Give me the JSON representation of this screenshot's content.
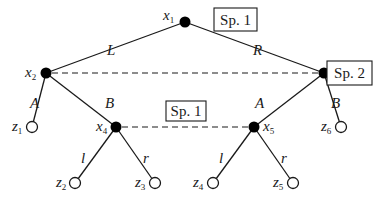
{
  "diagram": {
    "type": "extensive-form game tree",
    "nodes": [
      {
        "id": "x1",
        "name": "x",
        "sub": "1",
        "kind": "decision",
        "x": 185,
        "y": 22,
        "label_pos": "left"
      },
      {
        "id": "x2",
        "name": "x",
        "sub": "2",
        "kind": "decision",
        "x": 46,
        "y": 73,
        "label_pos": "left"
      },
      {
        "id": "x3",
        "name": "x",
        "sub": "3",
        "kind": "decision",
        "x": 324,
        "y": 73,
        "label_pos": "right"
      },
      {
        "id": "x4",
        "name": "x",
        "sub": "4",
        "kind": "decision",
        "x": 116,
        "y": 127,
        "label_pos": "left"
      },
      {
        "id": "x5",
        "name": "x",
        "sub": "5",
        "kind": "decision",
        "x": 254,
        "y": 127,
        "label_pos": "right"
      },
      {
        "id": "z1",
        "name": "z",
        "sub": "1",
        "kind": "terminal",
        "x": 32,
        "y": 127,
        "label_pos": "left"
      },
      {
        "id": "z2",
        "name": "z",
        "sub": "2",
        "kind": "terminal",
        "x": 75,
        "y": 183,
        "label_pos": "left"
      },
      {
        "id": "z3",
        "name": "z",
        "sub": "3",
        "kind": "terminal",
        "x": 155,
        "y": 183,
        "label_pos": "left"
      },
      {
        "id": "z4",
        "name": "z",
        "sub": "4",
        "kind": "terminal",
        "x": 213,
        "y": 183,
        "label_pos": "left"
      },
      {
        "id": "z5",
        "name": "z",
        "sub": "5",
        "kind": "terminal",
        "x": 293,
        "y": 183,
        "label_pos": "left"
      },
      {
        "id": "z6",
        "name": "z",
        "sub": "6",
        "kind": "terminal",
        "x": 341,
        "y": 127,
        "label_pos": "left"
      }
    ],
    "edges": [
      {
        "from": "x1",
        "to": "x2",
        "action": "L"
      },
      {
        "from": "x1",
        "to": "x3",
        "action": "R"
      },
      {
        "from": "x2",
        "to": "z1",
        "action": "A"
      },
      {
        "from": "x2",
        "to": "x4",
        "action": "B"
      },
      {
        "from": "x3",
        "to": "x5",
        "action": "A"
      },
      {
        "from": "x3",
        "to": "z6",
        "action": "B"
      },
      {
        "from": "x4",
        "to": "z2",
        "action": "l"
      },
      {
        "from": "x4",
        "to": "z3",
        "action": "r"
      },
      {
        "from": "x5",
        "to": "z4",
        "action": "l"
      },
      {
        "from": "x5",
        "to": "z5",
        "action": "r"
      }
    ],
    "information_sets": [
      {
        "nodes": [
          "x2",
          "x3"
        ],
        "style": "dashed"
      },
      {
        "nodes": [
          "x4",
          "x5"
        ],
        "style": "dashed"
      }
    ],
    "player_labels": [
      {
        "text": "Sp. 1",
        "attached_to": "x1"
      },
      {
        "text": "Sp. 2",
        "attached_to": "x2-x3"
      },
      {
        "text": "Sp. 1",
        "attached_to": "x4-x5"
      }
    ]
  }
}
